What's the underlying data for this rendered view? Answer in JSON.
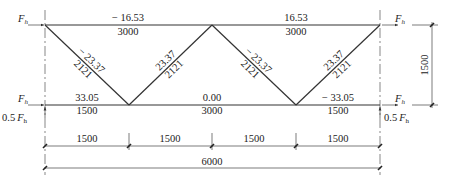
{
  "diagram": {
    "type": "truss-force-diagram",
    "loads": {
      "horizontal_symbol": "F",
      "horizontal_subscript": "h",
      "vertical_prefix": "0.5",
      "vertical_symbol": "F",
      "vertical_subscript": "h"
    },
    "members": {
      "top_left": {
        "force": "− 16.53",
        "length": "3000"
      },
      "top_right": {
        "force": "16.53",
        "length": "3000"
      },
      "bottom_left": {
        "force": "33.05",
        "length": "1500"
      },
      "bottom_middle": {
        "force": "0.00",
        "length": "3000"
      },
      "bottom_right": {
        "force": "− 33.05",
        "length": "1500"
      },
      "diag_1": {
        "force": "− 23.37",
        "length": "2121"
      },
      "diag_2": {
        "force": "23.37",
        "length": "2121"
      },
      "diag_3": {
        "force": "− 23.37",
        "length": "2121"
      },
      "diag_4": {
        "force": "23.37",
        "length": "2121"
      }
    },
    "dimensions": {
      "segments": [
        "1500",
        "1500",
        "1500",
        "1500"
      ],
      "total": "6000",
      "height": "1500"
    }
  }
}
